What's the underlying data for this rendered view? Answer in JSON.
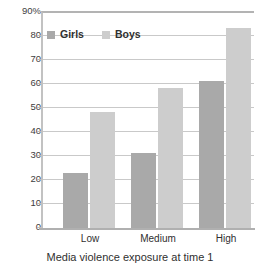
{
  "chart_data": {
    "type": "bar",
    "title": "",
    "xlabel": "Media violence exposure at time 1",
    "ylabel": "",
    "categories": [
      "Low",
      "Medium",
      "High"
    ],
    "series": [
      {
        "name": "Girls",
        "color": "#a9a9a9",
        "values": [
          23,
          31,
          61
        ]
      },
      {
        "name": "Boys",
        "color": "#cdcdcd",
        "values": [
          48,
          58,
          83
        ]
      }
    ],
    "ylim": [
      0,
      90
    ],
    "ytick_labels": [
      "90%",
      "80",
      "70",
      "60",
      "50",
      "40",
      "30",
      "20",
      "10",
      "0"
    ],
    "ytick_values": [
      90,
      80,
      70,
      60,
      50,
      40,
      30,
      20,
      10,
      0
    ],
    "grid": true,
    "legend_position": "top-left-inside",
    "legend_entries": [
      "Girls",
      "Boys"
    ]
  },
  "axis": {
    "y_unit_suffix": "%",
    "y_max": 90,
    "y_min": 0
  }
}
